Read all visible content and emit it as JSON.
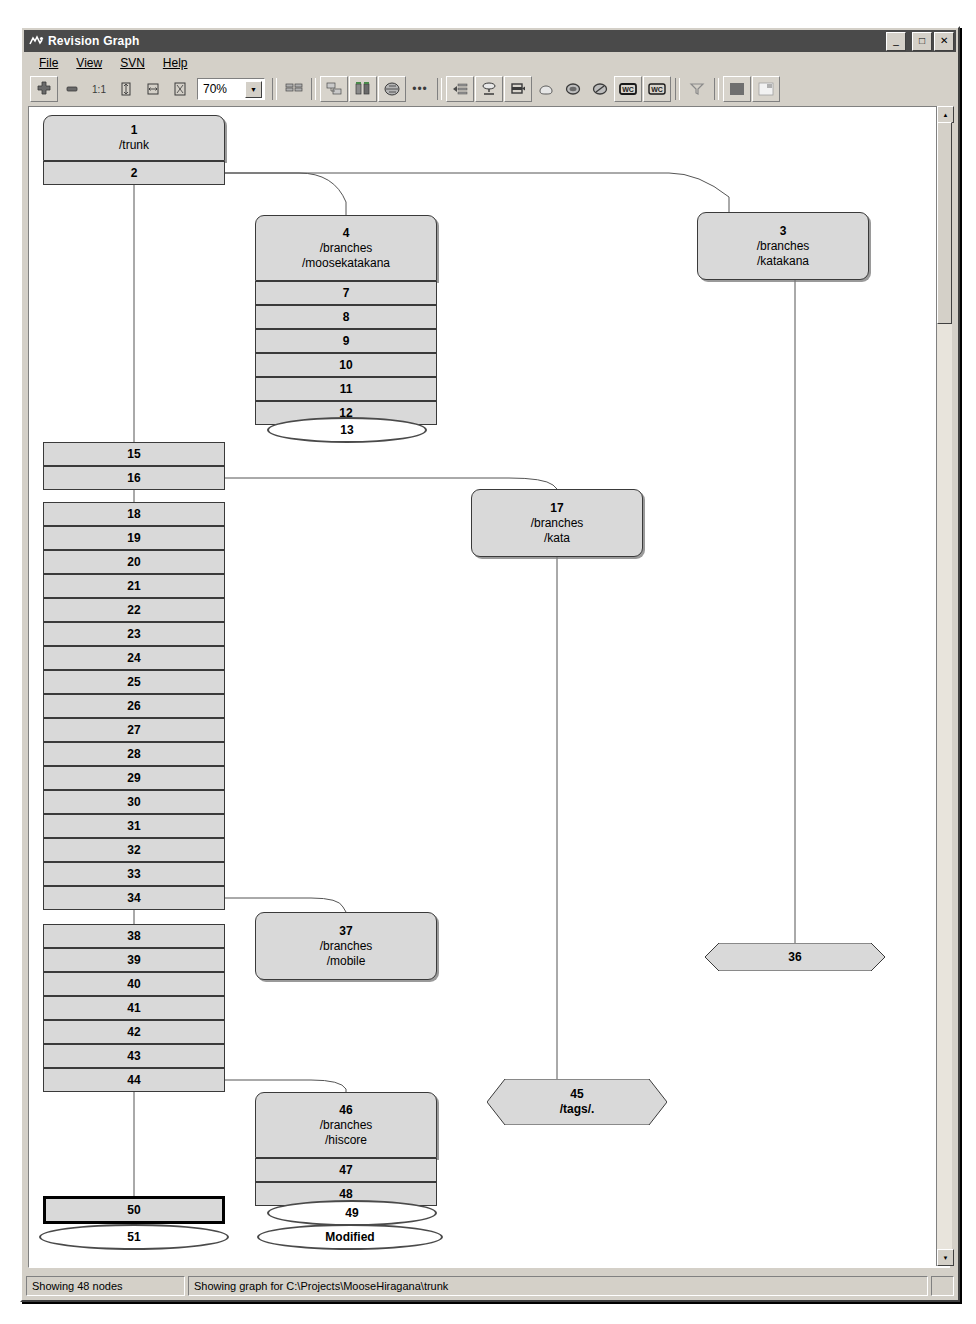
{
  "window": {
    "title": "Revision Graph",
    "icon": "app-icon",
    "minimize": "_",
    "maximize": "□",
    "close": "✕"
  },
  "menu": {
    "items": [
      {
        "label": "File",
        "accel": "F"
      },
      {
        "label": "View",
        "accel": "V"
      },
      {
        "label": "SVN",
        "accel": "S"
      },
      {
        "label": "Help",
        "accel": "H"
      }
    ]
  },
  "toolbar": {
    "zoom_value": "70%",
    "zoom_dropdown_glyph": "▼",
    "buttons": [
      {
        "name": "zoom-fit-icon",
        "glyph": "✛"
      },
      {
        "name": "zoom-out-icon",
        "glyph": "▬"
      },
      {
        "name": "zoom-100-icon",
        "glyph": "1:1"
      },
      {
        "name": "zoom-height-icon",
        "glyph": "⌷"
      },
      {
        "name": "zoom-width-icon",
        "glyph": "⌸"
      },
      {
        "name": "zoom-window-icon",
        "glyph": "⌹"
      },
      {
        "name": "group-branches-icon",
        "glyph": "▤▥"
      },
      {
        "name": "show-overview-icon",
        "glyph": "▦"
      },
      {
        "name": "compare-revisions-icon",
        "glyph": "▮▮"
      },
      {
        "name": "unified-diff-icon",
        "glyph": "◎"
      },
      {
        "name": "more-options-icon",
        "glyph": "•••"
      },
      {
        "name": "show-all-revisions-icon",
        "glyph": "◄"
      },
      {
        "name": "show-head-icon",
        "glyph": "⬭"
      },
      {
        "name": "show-tags-icon",
        "glyph": "⬓"
      },
      {
        "name": "show-modified-icon",
        "glyph": "⬬"
      },
      {
        "name": "show-deleted-icon",
        "glyph": "◯"
      },
      {
        "name": "hide-unrelated-icon",
        "glyph": "⊘"
      },
      {
        "name": "working-copy-a-icon",
        "glyph": "WC"
      },
      {
        "name": "working-copy-b-icon",
        "glyph": "WC"
      },
      {
        "name": "filter-icon",
        "glyph": "▽"
      },
      {
        "name": "fill-color-icon",
        "glyph": "■"
      },
      {
        "name": "save-graph-icon",
        "glyph": "▣"
      }
    ]
  },
  "statusbar": {
    "nodes_text": "Showing 48 nodes",
    "graph_text": "Showing graph for C:\\Projects\\MooseHiragana\\trunk",
    "resize_grip": ""
  },
  "graph": {
    "nodes": [
      {
        "id": "n1",
        "rev": "1",
        "path": "/trunk",
        "shape": "top",
        "x": 14,
        "y": 8,
        "w": 182,
        "h": 46
      },
      {
        "id": "n2",
        "rev": "2",
        "path": "",
        "shape": "plain",
        "x": 14,
        "y": 54,
        "w": 182,
        "h": 24
      },
      {
        "id": "n4",
        "rev": "4",
        "path": "/branches\n/moosekatakana",
        "shape": "top",
        "x": 226,
        "y": 108,
        "w": 182,
        "h": 66
      },
      {
        "id": "n7",
        "rev": "7",
        "path": "",
        "shape": "plain",
        "x": 226,
        "y": 174,
        "w": 182,
        "h": 24
      },
      {
        "id": "n8",
        "rev": "8",
        "path": "",
        "shape": "plain",
        "x": 226,
        "y": 198,
        "w": 182,
        "h": 24
      },
      {
        "id": "n9",
        "rev": "9",
        "path": "",
        "shape": "plain",
        "x": 226,
        "y": 222,
        "w": 182,
        "h": 24
      },
      {
        "id": "n10",
        "rev": "10",
        "path": "",
        "shape": "plain",
        "x": 226,
        "y": 246,
        "w": 182,
        "h": 24
      },
      {
        "id": "n11",
        "rev": "11",
        "path": "",
        "shape": "plain",
        "x": 226,
        "y": 270,
        "w": 182,
        "h": 24
      },
      {
        "id": "n12",
        "rev": "12",
        "path": "",
        "shape": "plain",
        "x": 226,
        "y": 294,
        "w": 182,
        "h": 24
      },
      {
        "id": "n3",
        "rev": "3",
        "path": "/branches\n/katakana",
        "shape": "round",
        "x": 668,
        "y": 105,
        "w": 172,
        "h": 68
      },
      {
        "id": "n15",
        "rev": "15",
        "path": "",
        "shape": "plain",
        "x": 14,
        "y": 335,
        "w": 182,
        "h": 24
      },
      {
        "id": "n16",
        "rev": "16",
        "path": "",
        "shape": "plain",
        "x": 14,
        "y": 359,
        "w": 182,
        "h": 24
      },
      {
        "id": "n17",
        "rev": "17",
        "path": "/branches\n/kata",
        "shape": "round",
        "x": 442,
        "y": 382,
        "w": 172,
        "h": 68
      },
      {
        "id": "n18",
        "rev": "18",
        "path": "",
        "shape": "plain",
        "x": 14,
        "y": 395,
        "w": 182,
        "h": 24
      },
      {
        "id": "n19",
        "rev": "19",
        "path": "",
        "shape": "plain",
        "x": 14,
        "y": 419,
        "w": 182,
        "h": 24
      },
      {
        "id": "n20",
        "rev": "20",
        "path": "",
        "shape": "plain",
        "x": 14,
        "y": 443,
        "w": 182,
        "h": 24
      },
      {
        "id": "n21",
        "rev": "21",
        "path": "",
        "shape": "plain",
        "x": 14,
        "y": 467,
        "w": 182,
        "h": 24
      },
      {
        "id": "n22",
        "rev": "22",
        "path": "",
        "shape": "plain",
        "x": 14,
        "y": 491,
        "w": 182,
        "h": 24
      },
      {
        "id": "n23",
        "rev": "23",
        "path": "",
        "shape": "plain",
        "x": 14,
        "y": 515,
        "w": 182,
        "h": 24
      },
      {
        "id": "n24",
        "rev": "24",
        "path": "",
        "shape": "plain",
        "x": 14,
        "y": 539,
        "w": 182,
        "h": 24
      },
      {
        "id": "n25",
        "rev": "25",
        "path": "",
        "shape": "plain",
        "x": 14,
        "y": 563,
        "w": 182,
        "h": 24
      },
      {
        "id": "n26",
        "rev": "26",
        "path": "",
        "shape": "plain",
        "x": 14,
        "y": 587,
        "w": 182,
        "h": 24
      },
      {
        "id": "n27",
        "rev": "27",
        "path": "",
        "shape": "plain",
        "x": 14,
        "y": 611,
        "w": 182,
        "h": 24
      },
      {
        "id": "n28",
        "rev": "28",
        "path": "",
        "shape": "plain",
        "x": 14,
        "y": 635,
        "w": 182,
        "h": 24
      },
      {
        "id": "n29",
        "rev": "29",
        "path": "",
        "shape": "plain",
        "x": 14,
        "y": 659,
        "w": 182,
        "h": 24
      },
      {
        "id": "n30",
        "rev": "30",
        "path": "",
        "shape": "plain",
        "x": 14,
        "y": 683,
        "w": 182,
        "h": 24
      },
      {
        "id": "n31",
        "rev": "31",
        "path": "",
        "shape": "plain",
        "x": 14,
        "y": 707,
        "w": 182,
        "h": 24
      },
      {
        "id": "n32",
        "rev": "32",
        "path": "",
        "shape": "plain",
        "x": 14,
        "y": 731,
        "w": 182,
        "h": 24
      },
      {
        "id": "n33",
        "rev": "33",
        "path": "",
        "shape": "plain",
        "x": 14,
        "y": 755,
        "w": 182,
        "h": 24
      },
      {
        "id": "n34",
        "rev": "34",
        "path": "",
        "shape": "plain",
        "x": 14,
        "y": 779,
        "w": 182,
        "h": 24
      },
      {
        "id": "n37",
        "rev": "37",
        "path": "/branches\n/mobile",
        "shape": "round",
        "x": 226,
        "y": 805,
        "w": 182,
        "h": 68
      },
      {
        "id": "n38",
        "rev": "38",
        "path": "",
        "shape": "plain",
        "x": 14,
        "y": 817,
        "w": 182,
        "h": 24
      },
      {
        "id": "n39",
        "rev": "39",
        "path": "",
        "shape": "plain",
        "x": 14,
        "y": 841,
        "w": 182,
        "h": 24
      },
      {
        "id": "n40",
        "rev": "40",
        "path": "",
        "shape": "plain",
        "x": 14,
        "y": 865,
        "w": 182,
        "h": 24
      },
      {
        "id": "n41",
        "rev": "41",
        "path": "",
        "shape": "plain",
        "x": 14,
        "y": 889,
        "w": 182,
        "h": 24
      },
      {
        "id": "n42",
        "rev": "42",
        "path": "",
        "shape": "plain",
        "x": 14,
        "y": 913,
        "w": 182,
        "h": 24
      },
      {
        "id": "n43",
        "rev": "43",
        "path": "",
        "shape": "plain",
        "x": 14,
        "y": 937,
        "w": 182,
        "h": 24
      },
      {
        "id": "n44",
        "rev": "44",
        "path": "",
        "shape": "plain",
        "x": 14,
        "y": 961,
        "w": 182,
        "h": 24
      },
      {
        "id": "n46",
        "rev": "46",
        "path": "/branches\n/hiscore",
        "shape": "top",
        "x": 226,
        "y": 985,
        "w": 182,
        "h": 66
      },
      {
        "id": "n47",
        "rev": "47",
        "path": "",
        "shape": "plain",
        "x": 226,
        "y": 1051,
        "w": 182,
        "h": 24
      },
      {
        "id": "n48",
        "rev": "48",
        "path": "",
        "shape": "plain",
        "x": 226,
        "y": 1075,
        "w": 182,
        "h": 24
      },
      {
        "id": "n50",
        "rev": "50",
        "path": "",
        "shape": "selected",
        "x": 14,
        "y": 1089,
        "w": 182,
        "h": 28
      }
    ],
    "hex_nodes": [
      {
        "id": "n36",
        "rev": "36",
        "path": "",
        "x": 676,
        "y": 836,
        "w": 180,
        "h": 28
      },
      {
        "id": "n45",
        "rev": "45",
        "path": "/tags/.",
        "x": 458,
        "y": 972,
        "w": 180,
        "h": 46
      }
    ],
    "ellipse_nodes": [
      {
        "id": "n13",
        "label": "13",
        "x": 238,
        "y": 310,
        "w": 160,
        "h": 26
      },
      {
        "id": "n49",
        "label": "49",
        "x": 238,
        "y": 1093,
        "w": 170,
        "h": 26
      },
      {
        "id": "n51",
        "label": "51",
        "x": 10,
        "y": 1117,
        "w": 190,
        "h": 26
      },
      {
        "id": "nmod",
        "label": "Modified",
        "x": 228,
        "y": 1117,
        "w": 186,
        "h": 26
      }
    ]
  },
  "colors": {
    "node_fill": "#d9d9d9",
    "node_border": "#3a3a3a",
    "window_chrome": "#d4d0c8",
    "titlebar": "#4a4a4a",
    "canvas": "#ffffff",
    "selected_border": "#000000"
  }
}
